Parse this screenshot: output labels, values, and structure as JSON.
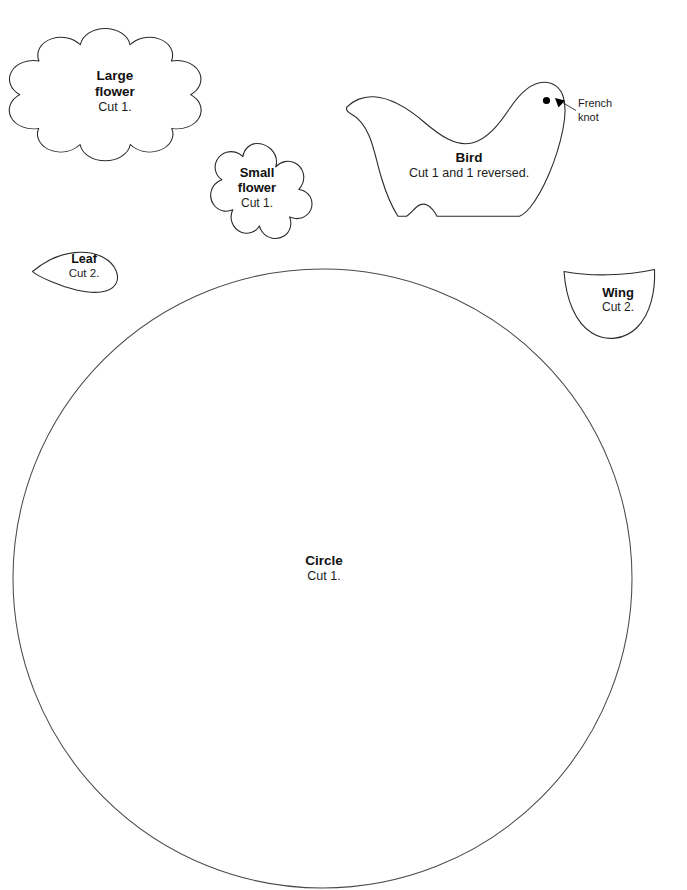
{
  "document": {
    "type": "sewing-pattern-template-sheet",
    "background_color": "#ffffff",
    "outline_color": "#2b2b2b"
  },
  "pieces": [
    {
      "id": "large-flower",
      "shape": "flower-8-petal",
      "title": "Large",
      "title2": "flower",
      "cut": "Cut 1."
    },
    {
      "id": "small-flower",
      "shape": "flower-6-petal",
      "title": "Small",
      "title2": "flower",
      "cut": "Cut 1."
    },
    {
      "id": "bird",
      "shape": "bird-body",
      "title": "Bird",
      "cut": "Cut 1 and 1 reversed."
    },
    {
      "id": "leaf",
      "shape": "teardrop",
      "title": "Leaf",
      "cut": "Cut 2."
    },
    {
      "id": "wing",
      "shape": "crescent",
      "title": "Wing",
      "cut": "Cut 2."
    },
    {
      "id": "circle",
      "shape": "circle",
      "title": "Circle",
      "cut": "Cut 1."
    }
  ],
  "annotations": {
    "french_knot": {
      "line1": "French",
      "line2": "knot",
      "marker": "filled-dot"
    }
  }
}
